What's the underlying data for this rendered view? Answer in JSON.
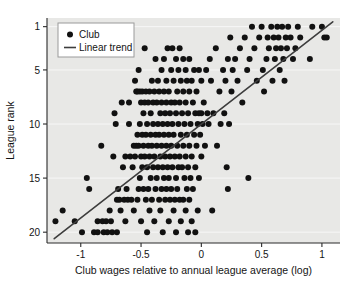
{
  "chart_data": {
    "type": "scatter",
    "title": "",
    "xlabel": "Club wages relative to annual league average (log)",
    "ylabel": "League rank",
    "xlim": [
      -1.28,
      1.15
    ],
    "ylim": [
      0.2,
      21.0
    ],
    "y_inverted": true,
    "xticks": [
      -1,
      -0.5,
      0,
      0.5,
      1
    ],
    "xtick_labels": [
      "-1",
      "-0.5",
      "0",
      "0.5",
      "1"
    ],
    "yticks": [
      1,
      5,
      10,
      15,
      20
    ],
    "ytick_labels": [
      "1",
      "5",
      "10",
      "15",
      "20"
    ],
    "grid": "horizontal",
    "plot_background": "#e8e8e6",
    "gridline_color": "#f7f7f7",
    "marker_color": "#111111",
    "marker_radius": 3.0,
    "line_color": "#3d3d3d",
    "line_width": 1.6,
    "legend_position": "top-left",
    "legend": [
      {
        "label": "Club",
        "marker": "circle"
      },
      {
        "label": "Linear trend",
        "marker": "line"
      }
    ],
    "trend_line": {
      "x1": -1.22,
      "y1": 20.6,
      "x2": 1.09,
      "y2": 0.55
    },
    "series": [
      {
        "name": "Club",
        "points": [
          [
            -1.21,
            19.0
          ],
          [
            -1.15,
            18.0
          ],
          [
            -1.05,
            19.0
          ],
          [
            -0.99,
            20.0
          ],
          [
            -0.95,
            15.0
          ],
          [
            -0.93,
            16.0
          ],
          [
            -0.89,
            20.0
          ],
          [
            -0.86,
            19.0
          ],
          [
            -0.86,
            20.0
          ],
          [
            -0.83,
            12.0
          ],
          [
            -0.82,
            19.0
          ],
          [
            -0.81,
            20.0
          ],
          [
            -0.79,
            19.0
          ],
          [
            -0.78,
            20.0
          ],
          [
            -0.76,
            18.0
          ],
          [
            -0.75,
            19.0
          ],
          [
            -0.74,
            20.0
          ],
          [
            -0.73,
            13.0
          ],
          [
            -0.72,
            9.0
          ],
          [
            -0.71,
            10.0
          ],
          [
            -0.7,
            17.0
          ],
          [
            -0.7,
            20.0
          ],
          [
            -0.69,
            16.0
          ],
          [
            -0.68,
            17.0
          ],
          [
            -0.67,
            18.0
          ],
          [
            -0.66,
            8.0
          ],
          [
            -0.65,
            14.0
          ],
          [
            -0.64,
            17.0
          ],
          [
            -0.63,
            13.0
          ],
          [
            -0.63,
            19.0
          ],
          [
            -0.62,
            16.0
          ],
          [
            -0.61,
            17.0
          ],
          [
            -0.6,
            8.0
          ],
          [
            -0.6,
            10.0
          ],
          [
            -0.59,
            13.0
          ],
          [
            -0.58,
            17.0
          ],
          [
            -0.57,
            14.0
          ],
          [
            -0.56,
            12.0
          ],
          [
            -0.56,
            18.0
          ],
          [
            -0.55,
            6.0
          ],
          [
            -0.55,
            13.0
          ],
          [
            -0.54,
            7.0
          ],
          [
            -0.54,
            12.0
          ],
          [
            -0.53,
            7.0
          ],
          [
            -0.53,
            11.0
          ],
          [
            -0.53,
            17.0
          ],
          [
            -0.52,
            5.0
          ],
          [
            -0.52,
            12.0
          ],
          [
            -0.52,
            16.0
          ],
          [
            -0.51,
            7.0
          ],
          [
            -0.51,
            10.0
          ],
          [
            -0.51,
            15.0
          ],
          [
            -0.5,
            8.0
          ],
          [
            -0.5,
            13.0
          ],
          [
            -0.5,
            19.0
          ],
          [
            -0.49,
            7.0
          ],
          [
            -0.49,
            11.0
          ],
          [
            -0.49,
            14.0
          ],
          [
            -0.48,
            9.0
          ],
          [
            -0.48,
            12.0
          ],
          [
            -0.48,
            16.0
          ],
          [
            -0.47,
            3.0
          ],
          [
            -0.47,
            8.0
          ],
          [
            -0.47,
            13.0
          ],
          [
            -0.46,
            7.0
          ],
          [
            -0.46,
            11.0
          ],
          [
            -0.46,
            17.0
          ],
          [
            -0.45,
            10.0
          ],
          [
            -0.45,
            14.0
          ],
          [
            -0.45,
            20.0
          ],
          [
            -0.44,
            8.0
          ],
          [
            -0.44,
            12.0
          ],
          [
            -0.44,
            16.0
          ],
          [
            -0.43,
            7.0
          ],
          [
            -0.43,
            13.0
          ],
          [
            -0.43,
            18.0
          ],
          [
            -0.42,
            9.0
          ],
          [
            -0.42,
            11.0
          ],
          [
            -0.42,
            15.0
          ],
          [
            -0.41,
            6.0
          ],
          [
            -0.41,
            12.0
          ],
          [
            -0.41,
            17.0
          ],
          [
            -0.4,
            8.0
          ],
          [
            -0.4,
            10.0
          ],
          [
            -0.4,
            14.0
          ],
          [
            -0.39,
            7.0
          ],
          [
            -0.39,
            13.0
          ],
          [
            -0.39,
            19.0
          ],
          [
            -0.38,
            4.0
          ],
          [
            -0.38,
            11.0
          ],
          [
            -0.38,
            16.0
          ],
          [
            -0.37,
            8.0
          ],
          [
            -0.37,
            12.0
          ],
          [
            -0.37,
            15.0
          ],
          [
            -0.36,
            6.0
          ],
          [
            -0.36,
            10.0
          ],
          [
            -0.36,
            14.0
          ],
          [
            -0.35,
            7.0
          ],
          [
            -0.35,
            11.0
          ],
          [
            -0.35,
            17.0
          ],
          [
            -0.34,
            9.0
          ],
          [
            -0.34,
            13.0
          ],
          [
            -0.34,
            18.0
          ],
          [
            -0.33,
            5.0
          ],
          [
            -0.33,
            8.0
          ],
          [
            -0.33,
            12.0
          ],
          [
            -0.33,
            16.0
          ],
          [
            -0.32,
            10.0
          ],
          [
            -0.32,
            14.0
          ],
          [
            -0.32,
            20.0
          ],
          [
            -0.31,
            4.0
          ],
          [
            -0.31,
            7.0
          ],
          [
            -0.31,
            11.0
          ],
          [
            -0.31,
            15.0
          ],
          [
            -0.3,
            9.0
          ],
          [
            -0.3,
            13.0
          ],
          [
            -0.3,
            17.0
          ],
          [
            -0.29,
            6.0
          ],
          [
            -0.29,
            8.0
          ],
          [
            -0.29,
            12.0
          ],
          [
            -0.29,
            16.0
          ],
          [
            -0.28,
            3.0
          ],
          [
            -0.28,
            10.0
          ],
          [
            -0.28,
            14.0
          ],
          [
            -0.27,
            7.0
          ],
          [
            -0.27,
            11.0
          ],
          [
            -0.27,
            15.0
          ],
          [
            -0.27,
            19.0
          ],
          [
            -0.26,
            9.0
          ],
          [
            -0.26,
            13.0
          ],
          [
            -0.26,
            17.0
          ],
          [
            -0.25,
            5.0
          ],
          [
            -0.25,
            8.0
          ],
          [
            -0.25,
            12.0
          ],
          [
            -0.25,
            16.0
          ],
          [
            -0.24,
            3.0
          ],
          [
            -0.24,
            10.0
          ],
          [
            -0.24,
            14.0
          ],
          [
            -0.23,
            6.0
          ],
          [
            -0.23,
            11.0
          ],
          [
            -0.23,
            18.0
          ],
          [
            -0.22,
            8.0
          ],
          [
            -0.22,
            13.0
          ],
          [
            -0.22,
            17.0
          ],
          [
            -0.21,
            4.0
          ],
          [
            -0.21,
            9.0
          ],
          [
            -0.21,
            15.0
          ],
          [
            -0.21,
            20.0
          ],
          [
            -0.2,
            7.0
          ],
          [
            -0.2,
            12.0
          ],
          [
            -0.2,
            16.0
          ],
          [
            -0.19,
            5.0
          ],
          [
            -0.19,
            10.0
          ],
          [
            -0.19,
            14.0
          ],
          [
            -0.18,
            3.0
          ],
          [
            -0.18,
            8.0
          ],
          [
            -0.18,
            13.0
          ],
          [
            -0.18,
            17.0
          ],
          [
            -0.17,
            6.0
          ],
          [
            -0.17,
            11.0
          ],
          [
            -0.17,
            19.0
          ],
          [
            -0.16,
            9.0
          ],
          [
            -0.16,
            14.0
          ],
          [
            -0.15,
            4.0
          ],
          [
            -0.15,
            7.0
          ],
          [
            -0.15,
            12.0
          ],
          [
            -0.15,
            17.0
          ],
          [
            -0.14,
            10.0
          ],
          [
            -0.14,
            15.0
          ],
          [
            -0.13,
            5.0
          ],
          [
            -0.13,
            8.0
          ],
          [
            -0.13,
            13.0
          ],
          [
            -0.13,
            18.0
          ],
          [
            -0.12,
            6.0
          ],
          [
            -0.12,
            11.0
          ],
          [
            -0.12,
            16.0
          ],
          [
            -0.11,
            9.0
          ],
          [
            -0.11,
            14.0
          ],
          [
            -0.11,
            20.0
          ],
          [
            -0.1,
            4.0
          ],
          [
            -0.1,
            7.0
          ],
          [
            -0.1,
            12.0
          ],
          [
            -0.1,
            17.0
          ],
          [
            -0.09,
            10.0
          ],
          [
            -0.09,
            15.0
          ],
          [
            -0.08,
            6.0
          ],
          [
            -0.08,
            13.0
          ],
          [
            -0.08,
            19.0
          ],
          [
            -0.07,
            8.0
          ],
          [
            -0.07,
            16.0
          ],
          [
            -0.06,
            5.0
          ],
          [
            -0.06,
            11.0
          ],
          [
            -0.05,
            9.0
          ],
          [
            -0.05,
            14.0
          ],
          [
            -0.05,
            20.0
          ],
          [
            -0.04,
            7.0
          ],
          [
            -0.04,
            12.0
          ],
          [
            -0.03,
            10.0
          ],
          [
            -0.03,
            18.0
          ],
          [
            -0.02,
            5.0
          ],
          [
            -0.02,
            9.0
          ],
          [
            -0.02,
            15.0
          ],
          [
            -0.01,
            11.0
          ],
          [
            0.0,
            6.0
          ],
          [
            0.0,
            9.0
          ],
          [
            0.0,
            13.0
          ],
          [
            0.01,
            10.0
          ],
          [
            0.02,
            8.0
          ],
          [
            0.03,
            12.0
          ],
          [
            0.04,
            5.0
          ],
          [
            0.05,
            9.0
          ],
          [
            0.06,
            10.0
          ],
          [
            0.07,
            4.0
          ],
          [
            0.08,
            6.0
          ],
          [
            0.09,
            18.0
          ],
          [
            0.1,
            9.0
          ],
          [
            0.12,
            3.0
          ],
          [
            0.13,
            12.0
          ],
          [
            0.15,
            7.0
          ],
          [
            0.16,
            10.0
          ],
          [
            0.18,
            5.0
          ],
          [
            0.19,
            9.0
          ],
          [
            0.2,
            6.0
          ],
          [
            0.21,
            14.0
          ],
          [
            0.22,
            4.0
          ],
          [
            0.22,
            16.0
          ],
          [
            0.23,
            10.0
          ],
          [
            0.24,
            2.0
          ],
          [
            0.25,
            7.0
          ],
          [
            0.26,
            5.0
          ],
          [
            0.28,
            4.0
          ],
          [
            0.3,
            6.0
          ],
          [
            0.32,
            3.0
          ],
          [
            0.34,
            8.0
          ],
          [
            0.36,
            2.0
          ],
          [
            0.38,
            5.0
          ],
          [
            0.39,
            15.0
          ],
          [
            0.4,
            4.0
          ],
          [
            0.42,
            1.0
          ],
          [
            0.44,
            3.0
          ],
          [
            0.46,
            6.0
          ],
          [
            0.48,
            2.0
          ],
          [
            0.5,
            1.0
          ],
          [
            0.51,
            5.0
          ],
          [
            0.52,
            7.0
          ],
          [
            0.54,
            4.0
          ],
          [
            0.55,
            2.0
          ],
          [
            0.56,
            3.0
          ],
          [
            0.58,
            1.0
          ],
          [
            0.59,
            6.0
          ],
          [
            0.6,
            2.0
          ],
          [
            0.61,
            4.0
          ],
          [
            0.62,
            3.0
          ],
          [
            0.63,
            1.0
          ],
          [
            0.64,
            2.0
          ],
          [
            0.65,
            5.0
          ],
          [
            0.66,
            3.0
          ],
          [
            0.67,
            1.0
          ],
          [
            0.68,
            4.0
          ],
          [
            0.69,
            6.0
          ],
          [
            0.7,
            2.0
          ],
          [
            0.71,
            3.0
          ],
          [
            0.72,
            1.0
          ],
          [
            0.74,
            2.0
          ],
          [
            0.76,
            4.0
          ],
          [
            0.78,
            3.0
          ],
          [
            0.8,
            1.0
          ],
          [
            0.82,
            2.0
          ],
          [
            0.9,
            4.0
          ],
          [
            0.92,
            1.0
          ],
          [
            1.0,
            1.0
          ],
          [
            1.02,
            2.0
          ],
          [
            1.04,
            2.0
          ]
        ]
      }
    ]
  }
}
